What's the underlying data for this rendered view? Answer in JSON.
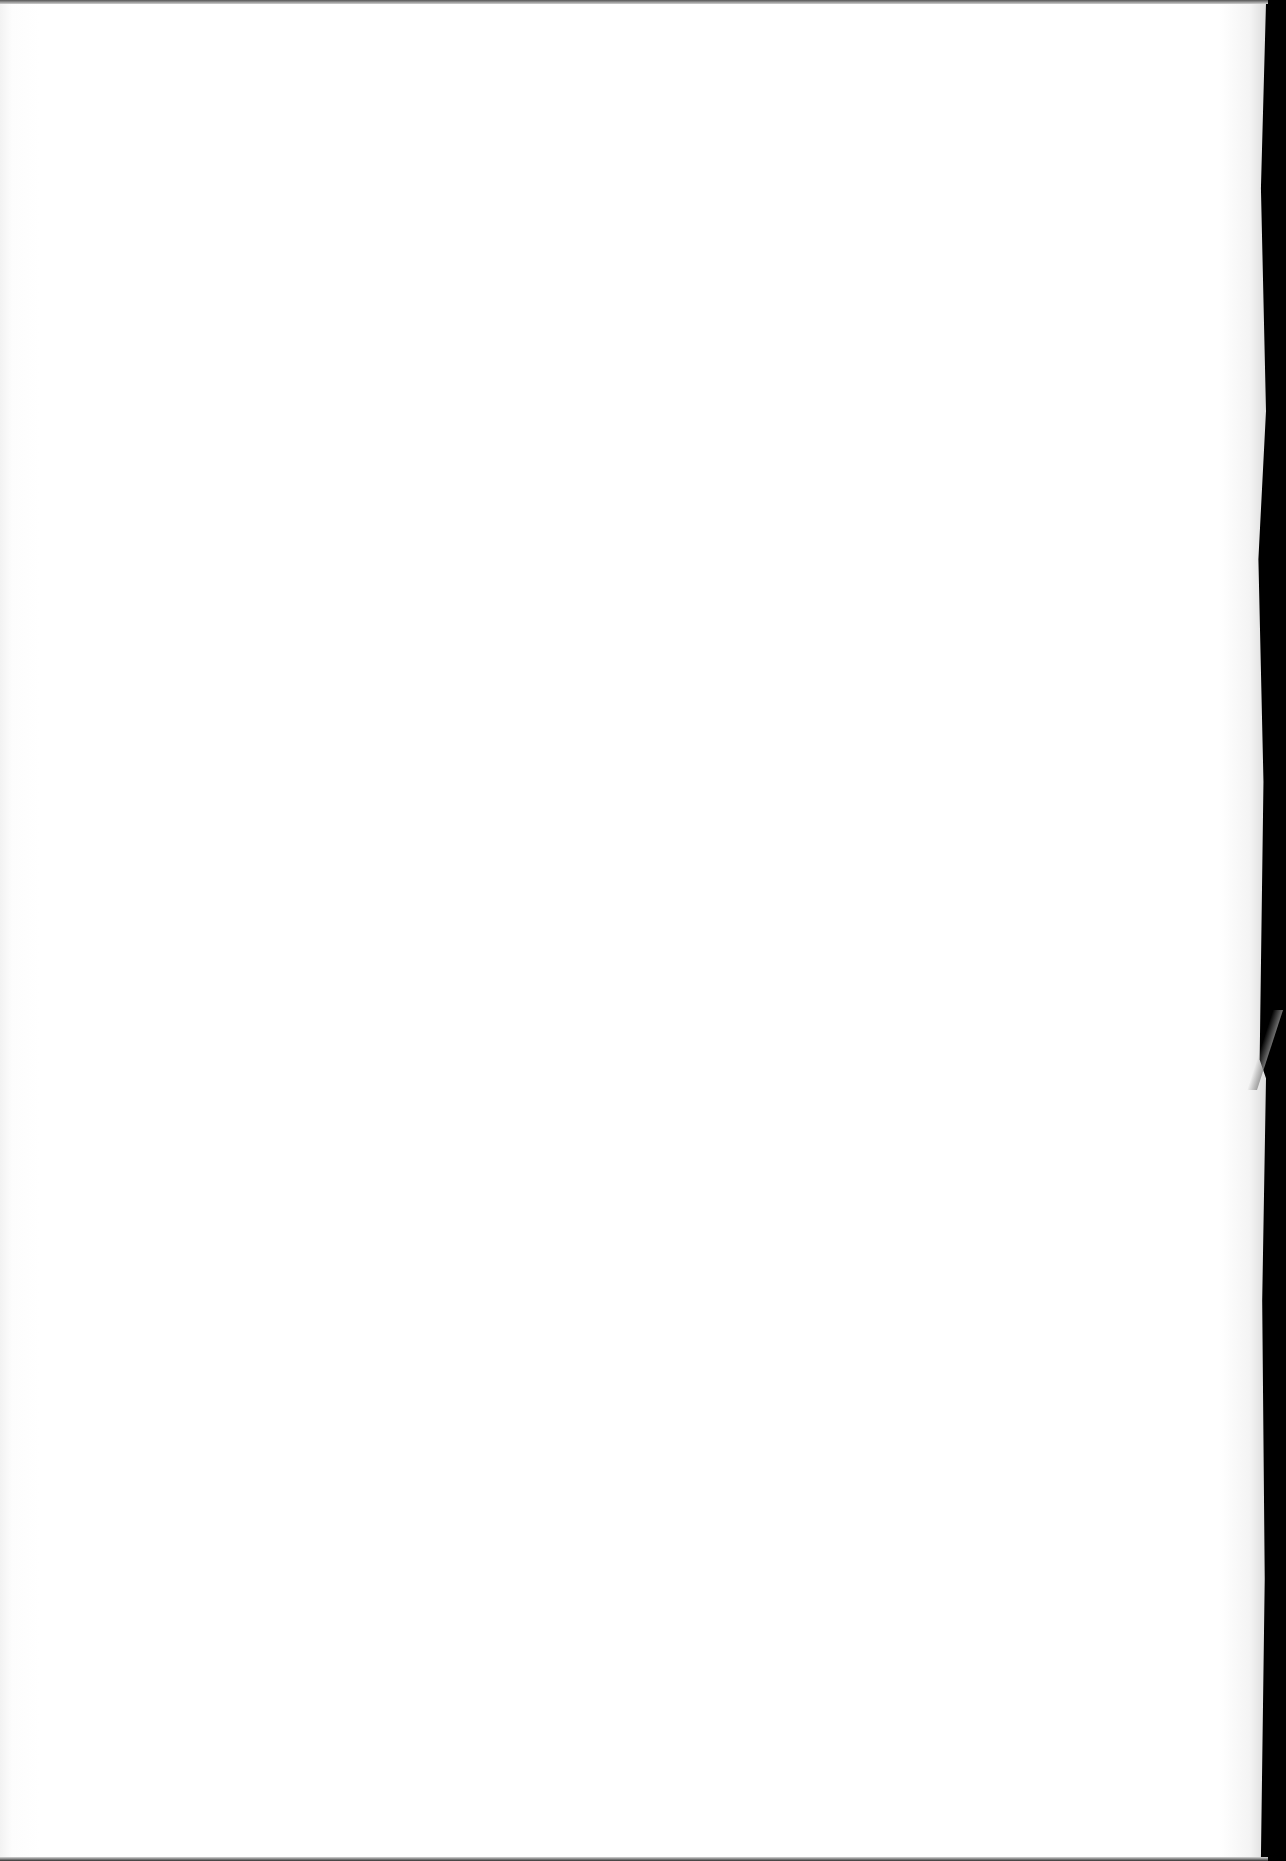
{
  "document": {
    "type": "blank-scanned-page",
    "background_color": "#ffffff",
    "border_color": "#000000",
    "visible_text": []
  }
}
